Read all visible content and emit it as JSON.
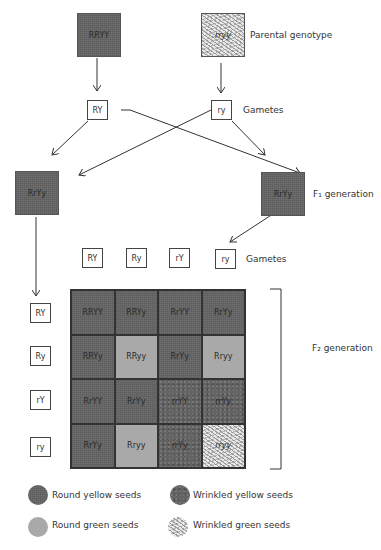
{
  "parental": {
    "left": {
      "genotype": "RRYY",
      "phenotype": "round-yellow"
    },
    "right": {
      "genotype": "rryy",
      "phenotype": "wrinkled-green"
    },
    "label": "Parental genotype"
  },
  "parental_gametes": {
    "left": "RY",
    "right": "ry",
    "label": "Gametes"
  },
  "f1": {
    "left": "RrYy",
    "right": "RrYy",
    "label": "F₁ generation"
  },
  "f1_gametes": {
    "items": [
      "RY",
      "Ry",
      "rY",
      "ry"
    ],
    "label": "Gametes"
  },
  "f2": {
    "label": "F₂ generation",
    "row_gametes": [
      "RY",
      "Ry",
      "rY",
      "ry"
    ],
    "rows": [
      [
        {
          "g": "RRYY",
          "p": "round-yellow"
        },
        {
          "g": "RRYy",
          "p": "round-yellow"
        },
        {
          "g": "RrYY",
          "p": "round-yellow"
        },
        {
          "g": "RrYy",
          "p": "round-yellow"
        }
      ],
      [
        {
          "g": "RRYy",
          "p": "round-yellow"
        },
        {
          "g": "RRyy",
          "p": "round-green"
        },
        {
          "g": "RrYy",
          "p": "round-yellow"
        },
        {
          "g": "Rryy",
          "p": "round-green"
        }
      ],
      [
        {
          "g": "RrYY",
          "p": "round-yellow"
        },
        {
          "g": "RrYy",
          "p": "round-yellow"
        },
        {
          "g": "rrYY",
          "p": "wrinkled-yellow"
        },
        {
          "g": "rrYy",
          "p": "wrinkled-yellow"
        }
      ],
      [
        {
          "g": "RrYy",
          "p": "round-yellow"
        },
        {
          "g": "Rryy",
          "p": "round-green"
        },
        {
          "g": "rrYy",
          "p": "wrinkled-yellow"
        },
        {
          "g": "rryy",
          "p": "wrinkled-green"
        }
      ]
    ]
  },
  "legend": {
    "round_yellow": "Round yellow seeds",
    "wrinkled_yellow": "Wrinkled yellow seeds",
    "round_green": "Round green seeds",
    "wrinkled_green": "Wrinkled green seeds"
  },
  "colors": {
    "round_yellow": "#6e6e6e",
    "round_green": "#a9a9a9",
    "wrinkled_yellow": "#646464",
    "wrinkled_green": "#e8e8e8"
  }
}
